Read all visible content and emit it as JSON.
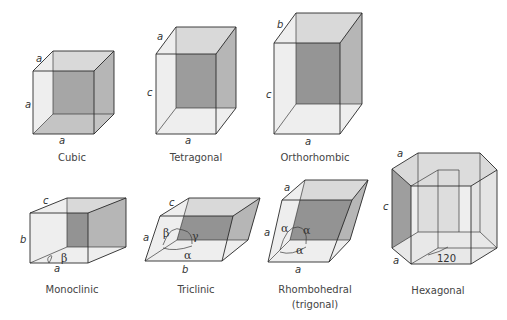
{
  "figure": {
    "background": "#ffffff",
    "shading": {
      "light": "#eeeeee",
      "mid": "#c4c4c4",
      "dark": "#9e9e9e",
      "edge": "#2a2a2a"
    }
  },
  "systems": [
    {
      "id": "cubic",
      "name": "Cubic",
      "axes": {
        "top": "a",
        "side": "a",
        "bottom": "a"
      }
    },
    {
      "id": "tetragonal",
      "name": "Tetragonal",
      "axes": {
        "top": "a",
        "side": "c",
        "bottom": "a"
      }
    },
    {
      "id": "orthorhombic",
      "name": "Orthorhombic",
      "axes": {
        "top": "b",
        "side": "c",
        "bottom": "a"
      }
    },
    {
      "id": "monoclinic",
      "name": "Monoclinic",
      "axes": {
        "top": "c",
        "side": "b",
        "bottom": "a"
      },
      "angles": [
        "β"
      ]
    },
    {
      "id": "triclinic",
      "name": "Triclinic",
      "axes": {
        "top": "c",
        "side": "a",
        "bottom": "b"
      },
      "angles": [
        "β",
        "γ",
        "α"
      ]
    },
    {
      "id": "rhombohedral",
      "name": "Rhombohedral",
      "subname": "(trigonal)",
      "axes": {
        "top": "a",
        "side": "a",
        "bottom": "a"
      },
      "angles": [
        "α",
        "α",
        "α"
      ]
    },
    {
      "id": "hexagonal",
      "name": "Hexagonal",
      "axes": {
        "top": "a",
        "side": "c",
        "bottom": "a"
      },
      "angle_value": "120"
    }
  ]
}
